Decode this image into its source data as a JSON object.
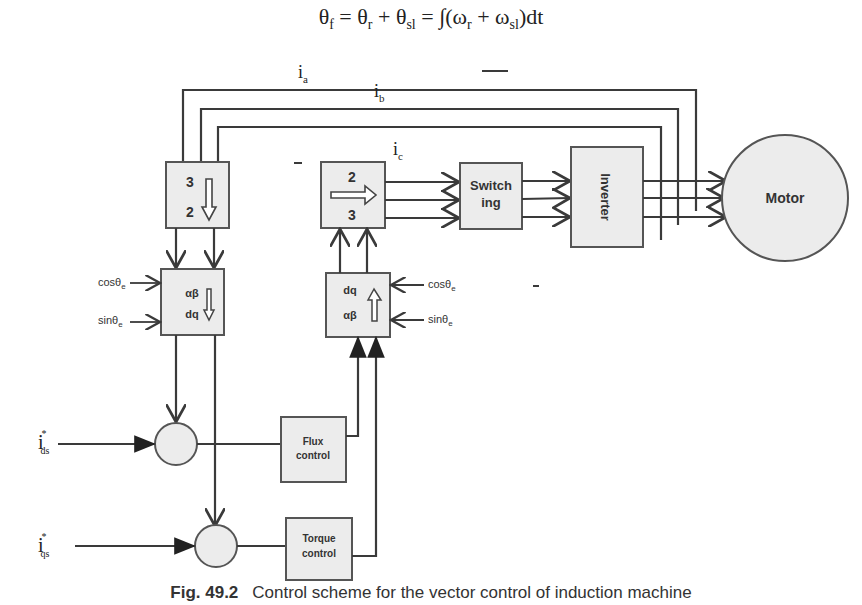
{
  "equation": {
    "lhs": "θ",
    "lhs_sub": "f",
    "eq1": " = θ",
    "t1_sub": "r",
    "plus1": " + θ",
    "t2_sub": "sl",
    "eq2": " = ∫(ω",
    "w1_sub": "r",
    "plus2": " + ω",
    "w2_sub": "sl",
    "tail": ")dt"
  },
  "signals": {
    "ia": "i",
    "ia_sub": "a",
    "ib": "i",
    "ib_sub": "b",
    "ic": "i",
    "ic_sub": "c",
    "ids": "i",
    "ids_sub": "ds",
    "ids_sup": "*",
    "iqs": "i",
    "iqs_sub": "qs",
    "iqs_sup": "*",
    "cos_left": "cosθ",
    "cos_left_sub": "e",
    "sin_left": "sinθ",
    "sin_left_sub": "e",
    "cos_right": "cosθ",
    "cos_right_sub": "e",
    "sin_right": "sinθ",
    "sin_right_sub": "e"
  },
  "blocks": {
    "three_to_two": {
      "top": "3",
      "bottom": "2"
    },
    "two_to_three": {
      "top": "2",
      "bottom": "3"
    },
    "ab_to_dq": {
      "top": "αβ",
      "bottom": "dq"
    },
    "dq_to_ab": {
      "top": "dq",
      "bottom": "αβ"
    },
    "switching": {
      "line1": "Switch",
      "line2": "ing"
    },
    "inverter": {
      "label": "Inverter"
    },
    "motor": {
      "label": "Motor"
    },
    "flux_control": {
      "line1": "Flux",
      "line2": "control"
    },
    "torque_control": {
      "line1": "Torque",
      "line2": "control"
    }
  },
  "caption": {
    "number": "Fig. 49.2",
    "text": "Control scheme for the vector control of induction machine"
  },
  "colors": {
    "line": "#3a3a3a",
    "block_fill": "#ececec",
    "block_stroke": "#555555"
  }
}
